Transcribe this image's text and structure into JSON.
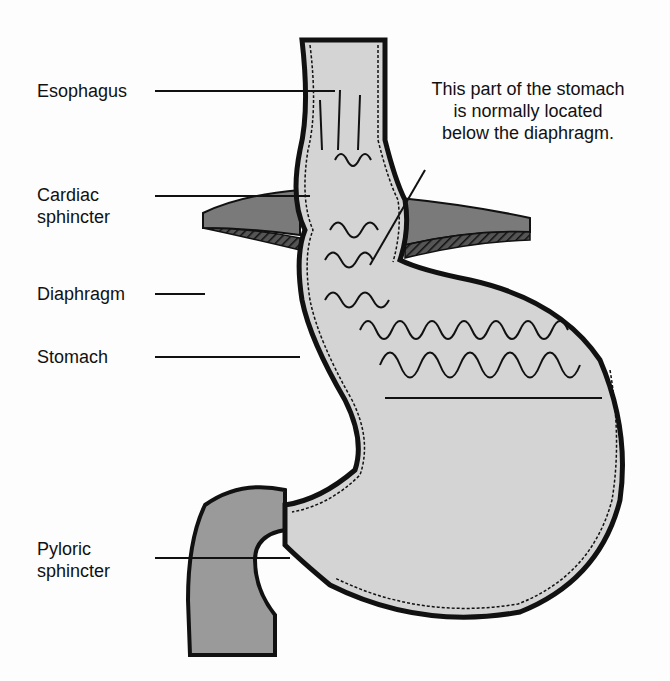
{
  "diagram": {
    "labels": [
      {
        "id": "esophagus",
        "text": "Esophagus"
      },
      {
        "id": "cardiac",
        "text": "Cardiac\nsphincter",
        "line1": "Cardiac",
        "line2": "sphincter"
      },
      {
        "id": "diaphragm",
        "text": "Diaphragm"
      },
      {
        "id": "stomach",
        "text": "Stomach"
      },
      {
        "id": "pyloric",
        "text": "Pyloric\nsphincter",
        "line1": "Pyloric",
        "line2": "sphincter"
      }
    ],
    "annotation": {
      "line1": "This part of the stomach",
      "line2": "is normally located",
      "line3": "below the diaphragm."
    },
    "colors": {
      "background": "#fdfdfd",
      "tissue_light": "#d4d4d4",
      "tissue_dark": "#9a9a9a",
      "diaphragm": "#7a7a7a",
      "outline": "#111111"
    }
  }
}
